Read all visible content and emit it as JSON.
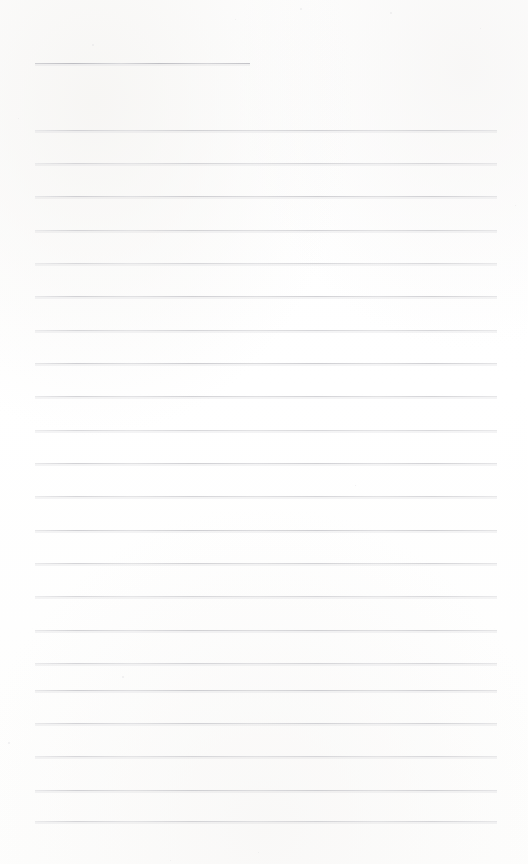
{
  "document": {
    "kind": "blank-lined-note-page",
    "title": "",
    "body_text": "",
    "page_width": 528,
    "page_height": 864,
    "background_color": "#ffffff",
    "rule_color": "#c9c9cd",
    "header_rule_color": "#bcbcc1",
    "is_blank": "true",
    "notes": ""
  },
  "layout": {
    "left_margin": 35,
    "right_margin": 31,
    "rule_left": 35,
    "rule_right_end": 497,
    "rule_span": 462,
    "line_pitch": 33.3,
    "first_body_rule_y": 130,
    "last_body_rule_y": 821,
    "top_blank_height": 63,
    "bottom_blank_height": 43
  },
  "header_rule": {
    "label": "title-rule",
    "y": 63,
    "x_start": 35,
    "x_end": 250,
    "width": 215
  },
  "body_rules": [
    {
      "index": 1,
      "y": 130
    },
    {
      "index": 2,
      "y": 163
    },
    {
      "index": 3,
      "y": 196
    },
    {
      "index": 4,
      "y": 230
    },
    {
      "index": 5,
      "y": 263
    },
    {
      "index": 6,
      "y": 296
    },
    {
      "index": 7,
      "y": 330
    },
    {
      "index": 8,
      "y": 363
    },
    {
      "index": 9,
      "y": 396
    },
    {
      "index": 10,
      "y": 430
    },
    {
      "index": 11,
      "y": 463
    },
    {
      "index": 12,
      "y": 496
    },
    {
      "index": 13,
      "y": 530
    },
    {
      "index": 14,
      "y": 563
    },
    {
      "index": 15,
      "y": 596
    },
    {
      "index": 16,
      "y": 630
    },
    {
      "index": 17,
      "y": 663
    },
    {
      "index": 18,
      "y": 690
    },
    {
      "index": 19,
      "y": 723
    },
    {
      "index": 20,
      "y": 756
    },
    {
      "index": 21,
      "y": 790
    },
    {
      "index": 22,
      "y": 821
    }
  ],
  "specks": [
    {
      "x": 92,
      "y": 44,
      "size": 2
    },
    {
      "x": 300,
      "y": 8,
      "size": 2
    },
    {
      "x": 235,
      "y": 19,
      "size": 1
    },
    {
      "x": 390,
      "y": 12,
      "size": 2
    },
    {
      "x": 480,
      "y": 28,
      "size": 1
    },
    {
      "x": 18,
      "y": 118,
      "size": 1
    },
    {
      "x": 355,
      "y": 485,
      "size": 1
    },
    {
      "x": 122,
      "y": 676,
      "size": 2
    },
    {
      "x": 258,
      "y": 852,
      "size": 1
    },
    {
      "x": 8,
      "y": 742,
      "size": 2
    },
    {
      "x": 515,
      "y": 205,
      "size": 1
    },
    {
      "x": 170,
      "y": 860,
      "size": 1
    }
  ]
}
